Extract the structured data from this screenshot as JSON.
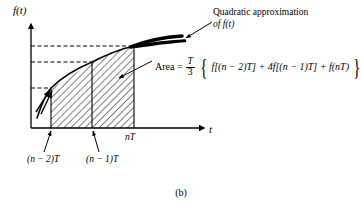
{
  "figure": {
    "caption": "(b)",
    "axes": {
      "y_label": "f(t)",
      "x_label": "t"
    },
    "tick_labels": {
      "left": "(n − 2)T",
      "middle": "(n − 1)T",
      "right": "nT"
    },
    "annotations": {
      "quadratic_line1": "Quadratic approximation",
      "quadratic_line2": "of f(t)"
    },
    "formula": {
      "area_word": "Area =",
      "fraction_numerator": "T",
      "fraction_denominator": "3",
      "brace_open": "{",
      "brace_close": "}",
      "body": "f[(n − 2)T] + 4f[(n − 1)T] + f(nT)"
    },
    "colors": {
      "ink": "#000000",
      "hatch": "#555555",
      "background": "#ffffff"
    }
  }
}
